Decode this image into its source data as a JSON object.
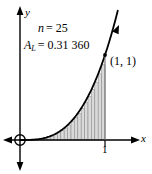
{
  "figure": {
    "type": "riemann-sum-diagram",
    "background_color": "#ffffff",
    "stroke_color": "#000000",
    "rect_fill_color": "#d9d9d9",
    "rect_stroke_color": "#8c8c8c"
  },
  "labels": {
    "n_variable": "n",
    "n_equals": "= 25",
    "n_value": "25",
    "area_variable": "A",
    "area_subscript": "L",
    "area_equals": "= 0.31 360",
    "area_value": "0.31 360",
    "point_label": "(1, 1)",
    "y_axis": "y",
    "x_axis": "x",
    "x_tick_one": "1"
  },
  "chart_data": {
    "type": "area",
    "title": "",
    "subtitle": "",
    "xlabel": "x",
    "ylabel": "y",
    "xlim": [
      -0.2,
      1.35
    ],
    "ylim": [
      -0.15,
      1.55
    ],
    "grid": false,
    "legend_position": "none",
    "annotations": [
      {
        "text": "n = 25",
        "x": 0.28,
        "y": 1.35
      },
      {
        "text": "A_L = 0.31 360",
        "x": 0.1,
        "y": 1.15
      },
      {
        "text": "(1, 1)",
        "x": 1.08,
        "y": 1.0
      }
    ],
    "curve": {
      "name": "y = x^3",
      "exponent": 3,
      "x": [
        0,
        0.1,
        0.2,
        0.3,
        0.4,
        0.5,
        0.6,
        0.7,
        0.8,
        0.9,
        1.0,
        1.15
      ],
      "y": [
        0,
        0.001,
        0.008,
        0.027,
        0.064,
        0.125,
        0.216,
        0.343,
        0.512,
        0.729,
        1.0,
        1.52
      ]
    },
    "riemann": {
      "rule": "left",
      "n": 25,
      "interval": [
        0,
        1
      ],
      "approximate_area": 0.3136,
      "area_label": "A_L",
      "rect_width": 0.04,
      "heights": [
        0.0,
        6.4e-05,
        0.000512,
        0.001728,
        0.004096,
        0.008,
        0.013824,
        0.021952,
        0.032768,
        0.046656,
        0.064,
        0.085184,
        0.110592,
        0.140608,
        0.175616,
        0.216,
        0.262144,
        0.314432,
        0.373248,
        0.438976,
        0.512,
        0.592704,
        0.681472,
        0.778688,
        0.884736
      ]
    },
    "points": [
      {
        "label": "(1, 1)",
        "x": 1.0,
        "y": 1.0
      },
      {
        "label": "origin",
        "x": 0.0,
        "y": 0.0
      }
    ],
    "ticks": {
      "x": [
        {
          "value": 1,
          "label": "1"
        }
      ],
      "y": []
    }
  }
}
